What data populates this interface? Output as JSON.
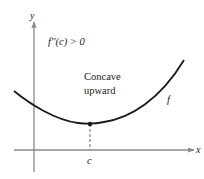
{
  "figure": {
    "condition_label": "f′′(c) > 0",
    "annotation_line1": "Concave",
    "annotation_line2": "upward",
    "function_label": "f",
    "point_label": "c",
    "x_axis_label": "x",
    "y_axis_label": "y"
  },
  "colors": {
    "axis": "#8a8a8a",
    "curve": "#1a1a1a",
    "text": "#222222",
    "background": "#ffffff"
  }
}
